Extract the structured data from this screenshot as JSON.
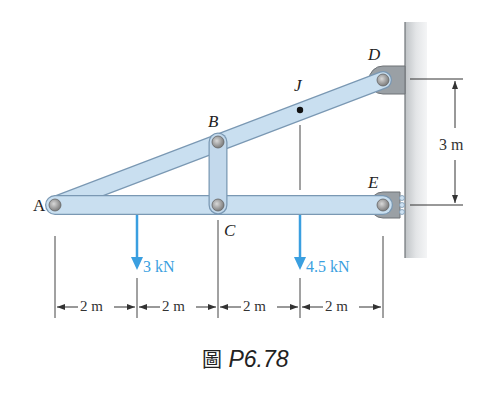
{
  "figure": {
    "caption_prefix": "圖",
    "caption_number": "P6.78"
  },
  "points": {
    "A": "A",
    "B": "B",
    "C": "C",
    "D": "D",
    "E": "E",
    "J": "J"
  },
  "loads": [
    {
      "label": "3 kN",
      "at_x_m": 2
    },
    {
      "label": "4.5 kN",
      "at_x_m": 6
    }
  ],
  "dimensions": {
    "horizontal": [
      "2 m",
      "2 m",
      "2 m",
      "2 m"
    ],
    "vertical": "3 m"
  },
  "colors": {
    "member_fill": "#c9dff0",
    "member_stroke": "#7a98b3",
    "load_arrow": "#3a9fe0",
    "wall": "#d6d9dc"
  }
}
